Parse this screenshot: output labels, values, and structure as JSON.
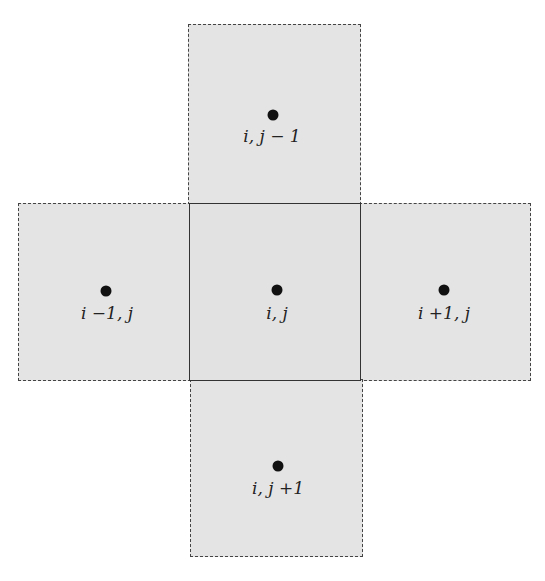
{
  "diagram": {
    "type": "finite-volume five-point stencil",
    "cells": [
      {
        "id": "north",
        "label": "i, j − 1",
        "border": "dashed"
      },
      {
        "id": "west",
        "label": "i −1, j",
        "border": "dashed"
      },
      {
        "id": "center",
        "label": "i, j",
        "border": "solid"
      },
      {
        "id": "east",
        "label": "i +1, j",
        "border": "dashed"
      },
      {
        "id": "south",
        "label": "i, j +1",
        "border": "dashed"
      }
    ],
    "colors": {
      "fill": "#e4e4e4",
      "border": "#444444",
      "dot": "#111111"
    }
  }
}
